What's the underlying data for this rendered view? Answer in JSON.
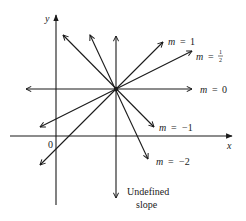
{
  "diagram": {
    "axes": {
      "x_label": "x",
      "y_label": "y",
      "origin_label": "0"
    },
    "lines": [
      {
        "id": "m1",
        "var": "m",
        "eq": "=",
        "value": "1"
      },
      {
        "id": "mhalf",
        "var": "m",
        "eq": "=",
        "num": "1",
        "den": "2"
      },
      {
        "id": "m0",
        "var": "m",
        "eq": "=",
        "value": "0"
      },
      {
        "id": "mneg1",
        "var": "m",
        "eq": "=",
        "value": "−1"
      },
      {
        "id": "mneg2",
        "var": "m",
        "eq": "=",
        "value": "−2"
      }
    ],
    "undefined_label_line1": "Undefined",
    "undefined_label_line2": "slope",
    "colors": {
      "ink": "#1a1a1a",
      "background": "#ffffff"
    }
  }
}
